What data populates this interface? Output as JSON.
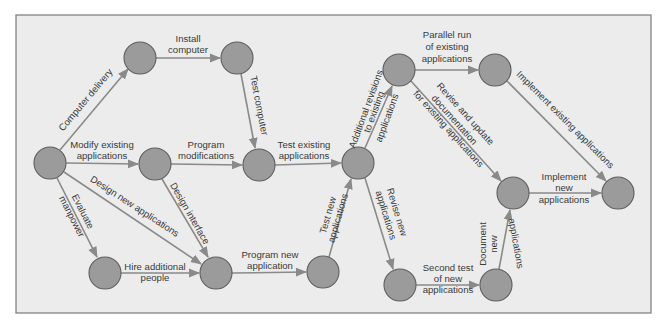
{
  "diagram": {
    "type": "network (PERT) diagram",
    "colors": {
      "background": "#ececec",
      "frame": "#7a7a7a",
      "node_fill": "#9b9b9b",
      "node_stroke": "#5e5e5e",
      "edge": "#8a8a8a",
      "text": "#3a3a3a"
    },
    "nodes": [
      {
        "id": "n1",
        "x": 50,
        "y": 163
      },
      {
        "id": "n2",
        "x": 140,
        "y": 58
      },
      {
        "id": "n3",
        "x": 237,
        "y": 58
      },
      {
        "id": "n4",
        "x": 155,
        "y": 164
      },
      {
        "id": "n5",
        "x": 259,
        "y": 165
      },
      {
        "id": "n6",
        "x": 105,
        "y": 273
      },
      {
        "id": "n7",
        "x": 216,
        "y": 273
      },
      {
        "id": "n8",
        "x": 323,
        "y": 272
      },
      {
        "id": "n9",
        "x": 358,
        "y": 163
      },
      {
        "id": "n10",
        "x": 399,
        "y": 70
      },
      {
        "id": "n11",
        "x": 495,
        "y": 70
      },
      {
        "id": "n12",
        "x": 513,
        "y": 193
      },
      {
        "id": "n13",
        "x": 618,
        "y": 193
      },
      {
        "id": "n14",
        "x": 400,
        "y": 285
      },
      {
        "id": "n15",
        "x": 496,
        "y": 285
      }
    ],
    "edges": [
      {
        "from": "n1",
        "to": "n2",
        "label": [
          "Computer delivery"
        ]
      },
      {
        "from": "n2",
        "to": "n3",
        "label": [
          "Install",
          "computer"
        ]
      },
      {
        "from": "n3",
        "to": "n5",
        "label": [
          "Test computer"
        ]
      },
      {
        "from": "n1",
        "to": "n4",
        "label": [
          "Modify existing",
          "applications"
        ]
      },
      {
        "from": "n4",
        "to": "n5",
        "label": [
          "Program",
          "modifications"
        ]
      },
      {
        "from": "n5",
        "to": "n9",
        "label": [
          "Test existing",
          "applications"
        ]
      },
      {
        "from": "n1",
        "to": "n7",
        "label": [
          "Design new applications"
        ]
      },
      {
        "from": "n1",
        "to": "n6",
        "label": [
          "Evaluate",
          "manpower"
        ]
      },
      {
        "from": "n4",
        "to": "n7",
        "label": [
          "Design interface"
        ]
      },
      {
        "from": "n6",
        "to": "n7",
        "label": [
          "Hire additional",
          "people"
        ]
      },
      {
        "from": "n7",
        "to": "n8",
        "label": [
          "Program new",
          "application"
        ]
      },
      {
        "from": "n8",
        "to": "n9",
        "label": [
          "Test new",
          "applications"
        ]
      },
      {
        "from": "n9",
        "to": "n10",
        "label": [
          "Additional revisions",
          "to existing",
          "applications"
        ]
      },
      {
        "from": "n10",
        "to": "n11",
        "label": [
          "Parallel run",
          "of existing",
          "applications"
        ]
      },
      {
        "from": "n10",
        "to": "n12",
        "label": [
          "Revise and update",
          "documentation",
          "for existing applications"
        ]
      },
      {
        "from": "n11",
        "to": "n13",
        "label": [
          "Implement existing applications"
        ]
      },
      {
        "from": "n9",
        "to": "n14",
        "label": [
          "Revise new",
          "applications"
        ]
      },
      {
        "from": "n14",
        "to": "n15",
        "label": [
          "Second test",
          "of new",
          "applications"
        ]
      },
      {
        "from": "n15",
        "to": "n12",
        "label": [
          "Document",
          "new",
          "applications"
        ]
      },
      {
        "from": "n12",
        "to": "n13",
        "label": [
          "Implement",
          "new",
          "applications"
        ]
      }
    ],
    "labels": {
      "computer_delivery": "Computer delivery",
      "install_1": "Install",
      "install_2": "computer",
      "test_computer": "Test computer",
      "modify_1": "Modify existing",
      "modify_2": "applications",
      "progmod_1": "Program",
      "progmod_2": "modifications",
      "testexist_1": "Test existing",
      "testexist_2": "applications",
      "design_new": "Design new applications",
      "evaluate_1": "Evaluate",
      "evaluate_2": "manpower",
      "design_interface": "Design interface",
      "hire_1": "Hire additional",
      "hire_2": "people",
      "prognew_1": "Program new",
      "prognew_2": "application",
      "testnew_1": "Test new",
      "testnew_2": "applications",
      "addrev_1": "Additional revisions",
      "addrev_2": "to existing",
      "addrev_3": "applications",
      "parallel_1": "Parallel run",
      "parallel_2": "of existing",
      "parallel_3": "applications",
      "revdoc_1": "Revise and update",
      "revdoc_2": "documentation",
      "revdoc_3": "for existing applications",
      "implexist": "Implement existing applications",
      "revnew_1": "Revise new",
      "revnew_2": "applications",
      "second_1": "Second test",
      "second_2": "of new",
      "second_3": "applications",
      "doc_1": "Document",
      "doc_2": "new",
      "doc_3": "applications",
      "implnew_1": "Implement",
      "implnew_2": "new",
      "implnew_3": "applications"
    }
  }
}
